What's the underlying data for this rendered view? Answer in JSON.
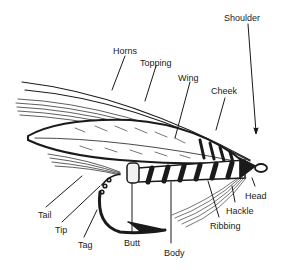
{
  "diagram": {
    "colors": {
      "ink": "#1a1a1a",
      "background": "#ffffff"
    },
    "labels": [
      {
        "id": "shoulder",
        "text": "Shoulder",
        "x": 224,
        "y": 13
      },
      {
        "id": "horns",
        "text": "Horns",
        "x": 113,
        "y": 46
      },
      {
        "id": "topping",
        "text": "Topping",
        "x": 140,
        "y": 58
      },
      {
        "id": "wing",
        "text": "Wing",
        "x": 178,
        "y": 73
      },
      {
        "id": "cheek",
        "text": "Cheek",
        "x": 211,
        "y": 86
      },
      {
        "id": "head",
        "text": "Head",
        "x": 245,
        "y": 191
      },
      {
        "id": "hackle",
        "text": "Hackle",
        "x": 226,
        "y": 206
      },
      {
        "id": "ribbing",
        "text": "Ribbing",
        "x": 210,
        "y": 221
      },
      {
        "id": "tail",
        "text": "Tail",
        "x": 38,
        "y": 210
      },
      {
        "id": "tip",
        "text": "Tip",
        "x": 55,
        "y": 225
      },
      {
        "id": "tag",
        "text": "Tag",
        "x": 78,
        "y": 240
      },
      {
        "id": "butt",
        "text": "Butt",
        "x": 124,
        "y": 238
      },
      {
        "id": "body",
        "text": "Body",
        "x": 164,
        "y": 248
      }
    ]
  }
}
